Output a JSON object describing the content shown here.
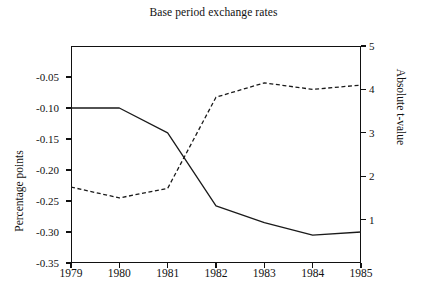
{
  "chart_data": {
    "type": "line",
    "title": "Base period exchange rates",
    "xlabel": "",
    "ylabel": "Percentage points",
    "y2label": "Absolute t-value",
    "grid": false,
    "legend": "none",
    "x": [
      1979,
      1980,
      1981,
      1982,
      1983,
      1984,
      1985
    ],
    "categories": [
      "1979",
      "1980",
      "1981",
      "1982",
      "1983",
      "1984",
      "1985"
    ],
    "xlim": [
      1979,
      1985
    ],
    "ylim": [
      -0.35,
      0.0
    ],
    "y2lim": [
      0,
      5
    ],
    "yticks": [
      -0.05,
      -0.1,
      -0.15,
      -0.2,
      -0.25,
      -0.3,
      -0.35
    ],
    "ytick_labels": [
      "-0.05",
      "-0.10",
      "-0.15",
      "-0.20",
      "-0.25",
      "-0.30",
      "-0.35"
    ],
    "y2ticks": [
      1,
      2,
      3,
      4,
      5
    ],
    "y2tick_labels": [
      "1",
      "2",
      "3",
      "4",
      "5"
    ],
    "series": [
      {
        "name": "Percentage points",
        "axis": "left",
        "style": "solid",
        "color": "#1a1a1a",
        "values": [
          -0.1,
          -0.1,
          -0.14,
          -0.258,
          -0.285,
          -0.305,
          -0.3
        ]
      },
      {
        "name": "Absolute t-value",
        "axis": "right",
        "style": "dashed",
        "color": "#1a1a1a",
        "values": [
          1.75,
          1.5,
          1.72,
          3.82,
          4.15,
          4.0,
          4.1
        ]
      }
    ]
  }
}
